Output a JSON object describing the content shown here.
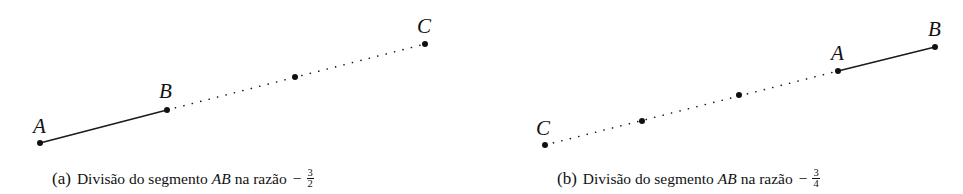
{
  "figures": [
    {
      "id": "a",
      "caption": {
        "tag": "(a)",
        "text": "Divisão do segmento",
        "segment": "AB",
        "mid": "na razão",
        "sign": "−",
        "numerator": "3",
        "denominator": "2"
      },
      "points": {
        "A": {
          "label": "A",
          "x": 40,
          "y": 143
        },
        "B": {
          "label": "B",
          "x": 167,
          "y": 110
        },
        "M": {
          "label": "",
          "x": 295,
          "y": 77
        },
        "C": {
          "label": "C",
          "x": 425,
          "y": 44
        }
      },
      "solid_segment": [
        "A",
        "B"
      ],
      "dotted_segment": [
        "B",
        "C"
      ]
    },
    {
      "id": "b",
      "caption": {
        "tag": "(b)",
        "text": "Divisão do segmento",
        "segment": "AB",
        "mid": "na razão",
        "sign": "−",
        "numerator": "3",
        "denominator": "4"
      },
      "points": {
        "C": {
          "label": "C",
          "x": 545,
          "y": 145
        },
        "M1": {
          "label": "",
          "x": 642,
          "y": 121
        },
        "M2": {
          "label": "",
          "x": 739,
          "y": 95
        },
        "A": {
          "label": "A",
          "x": 838,
          "y": 71
        },
        "B": {
          "label": "B",
          "x": 935,
          "y": 47
        }
      },
      "solid_segment": [
        "A",
        "B"
      ],
      "dotted_segment": [
        "C",
        "A"
      ]
    }
  ],
  "colors": {
    "ink": "#111111",
    "background": "#ffffff"
  }
}
